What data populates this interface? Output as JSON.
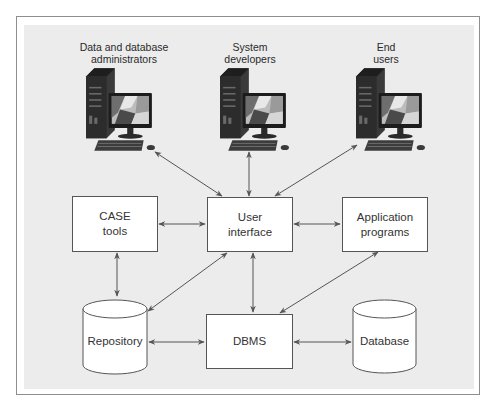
{
  "actors": [
    {
      "id": "dba",
      "label_lines": [
        "Data and database",
        "administrators"
      ],
      "icon": "desktop-computer-icon"
    },
    {
      "id": "dev",
      "label_lines": [
        "System",
        "developers"
      ],
      "icon": "desktop-computer-icon"
    },
    {
      "id": "end",
      "label_lines": [
        "End",
        "users"
      ],
      "icon": "desktop-computer-icon"
    }
  ],
  "components": {
    "case_tools": {
      "label_lines": [
        "CASE",
        "tools"
      ],
      "shape": "rectangle"
    },
    "user_interface": {
      "label_lines": [
        "User",
        "interface"
      ],
      "shape": "rectangle"
    },
    "application_programs": {
      "label_lines": [
        "Application",
        "programs"
      ],
      "shape": "rectangle"
    },
    "repository": {
      "label": "Repository",
      "shape": "cylinder"
    },
    "dbms": {
      "label": "DBMS",
      "shape": "rectangle"
    },
    "database": {
      "label": "Database",
      "shape": "cylinder"
    }
  },
  "connections": [
    {
      "from": "Data and database administrators",
      "to": "User interface",
      "bidirectional": true
    },
    {
      "from": "System developers",
      "to": "User interface",
      "bidirectional": true
    },
    {
      "from": "End users",
      "to": "User interface",
      "bidirectional": true
    },
    {
      "from": "CASE tools",
      "to": "User interface",
      "bidirectional": true
    },
    {
      "from": "User interface",
      "to": "Application programs",
      "bidirectional": true
    },
    {
      "from": "CASE tools",
      "to": "Repository",
      "bidirectional": true
    },
    {
      "from": "User interface",
      "to": "Repository",
      "bidirectional": true
    },
    {
      "from": "User interface",
      "to": "DBMS",
      "bidirectional": true
    },
    {
      "from": "Application programs",
      "to": "DBMS",
      "bidirectional": true
    },
    {
      "from": "Repository",
      "to": "DBMS",
      "bidirectional": true
    },
    {
      "from": "DBMS",
      "to": "Database",
      "bidirectional": true
    }
  ],
  "colors": {
    "background": "#ececec",
    "frame_border": "#8e8e8e",
    "box_fill": "#ffffff",
    "box_border": "#555555",
    "arrow": "#555555"
  }
}
